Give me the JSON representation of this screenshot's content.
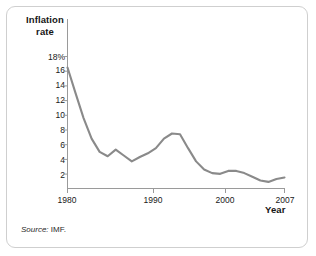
{
  "figure": {
    "source_prefix": "Source:",
    "source_value": "IMF.",
    "y_axis_title_line1": "Inflation",
    "y_axis_title_line2": "rate",
    "x_axis_title": "Year"
  },
  "chart_data": {
    "type": "line",
    "title": "",
    "subtitle": "",
    "xlabel": "Year",
    "ylabel": "Inflation rate",
    "grid": false,
    "legend": "none",
    "line_color": "#8a8a8a",
    "axis_color": "#9a9a9a",
    "xlim": [
      1980,
      2007
    ],
    "ylim": [
      0,
      19
    ],
    "y_ticks": [
      2,
      4,
      6,
      8,
      10,
      12,
      14,
      16,
      18
    ],
    "y_tick_labels": [
      "2",
      "4",
      "6",
      "8",
      "10",
      "12",
      "14",
      "16",
      "18%"
    ],
    "x_ticks": [
      1980,
      1990,
      2000,
      2007
    ],
    "x_tick_labels": [
      "1980",
      "1990",
      "2000",
      "2007"
    ],
    "series": [
      {
        "name": "Inflation rate",
        "x": [
          1980,
          1981,
          1982,
          1983,
          1984,
          1985,
          1986,
          1987,
          1988,
          1989,
          1990,
          1991,
          1992,
          1993,
          1994,
          1995,
          1996,
          1997,
          1998,
          1999,
          2000,
          2001,
          2002,
          2003,
          2004,
          2005,
          2006,
          2007
        ],
        "values": [
          16.5,
          13.0,
          9.6,
          6.8,
          5.0,
          4.4,
          5.3,
          4.5,
          3.7,
          4.3,
          4.8,
          5.5,
          6.8,
          7.5,
          7.4,
          5.5,
          3.7,
          2.6,
          2.1,
          2.0,
          2.4,
          2.4,
          2.1,
          1.6,
          1.1,
          0.9,
          1.3,
          1.5
        ],
        "values_continued_note": ""
      }
    ]
  }
}
